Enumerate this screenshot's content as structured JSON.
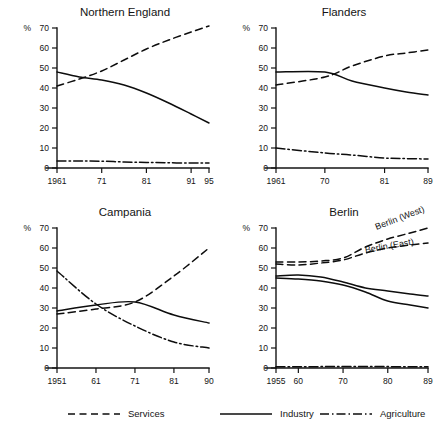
{
  "figure": {
    "title": "",
    "panel_count": 4
  },
  "legend": {
    "entries": [
      {
        "label": "Services",
        "style": "dashed"
      },
      {
        "label": "Industry",
        "style": "solid"
      },
      {
        "label": "Agriculture",
        "style": "dashdot"
      }
    ]
  },
  "chart_data": [
    {
      "type": "line",
      "title": "Northern England",
      "xlabel": "",
      "ylabel": "%",
      "ylim": [
        0,
        70
      ],
      "yticks": [
        0,
        10,
        20,
        30,
        40,
        50,
        60,
        70
      ],
      "xlim": [
        1961,
        1995
      ],
      "xticks": [
        1961,
        1971,
        1981,
        1991,
        1995
      ],
      "xticklabels": [
        "1961",
        "71",
        "81",
        "91",
        "95"
      ],
      "grid": false,
      "legend_position": "figure-bottom",
      "series": [
        {
          "name": "Services",
          "style": "dashed",
          "x": [
            1961,
            1966,
            1971,
            1976,
            1981,
            1986,
            1991,
            1995
          ],
          "values": [
            41.0,
            44.5,
            48.5,
            54.0,
            59.5,
            64.0,
            68.0,
            71.0
          ]
        },
        {
          "name": "Industry",
          "style": "solid",
          "x": [
            1961,
            1966,
            1971,
            1976,
            1981,
            1986,
            1991,
            1995
          ],
          "values": [
            48.0,
            45.5,
            44.0,
            41.5,
            37.5,
            32.5,
            27.0,
            22.5
          ]
        },
        {
          "name": "Agriculture",
          "style": "dashdot",
          "x": [
            1961,
            1966,
            1971,
            1976,
            1981,
            1986,
            1991,
            1995
          ],
          "values": [
            3.5,
            3.5,
            3.4,
            3.0,
            2.8,
            2.6,
            2.5,
            2.5
          ]
        }
      ]
    },
    {
      "type": "line",
      "title": "Flanders",
      "xlabel": "",
      "ylabel": "%",
      "ylim": [
        0,
        70
      ],
      "yticks": [
        0,
        10,
        20,
        30,
        40,
        50,
        60,
        70
      ],
      "xlim": [
        1961,
        1989
      ],
      "xticks": [
        1961,
        1970,
        1981,
        1989
      ],
      "xticklabels": [
        "1961",
        "70",
        "81",
        "89"
      ],
      "grid": false,
      "legend_position": "figure-bottom",
      "series": [
        {
          "name": "Services",
          "style": "dashed",
          "x": [
            1961,
            1970,
            1975,
            1981,
            1985,
            1989
          ],
          "values": [
            41.5,
            45.5,
            51.0,
            56.0,
            57.5,
            59.0
          ]
        },
        {
          "name": "Industry",
          "style": "solid",
          "x": [
            1961,
            1970,
            1975,
            1981,
            1985,
            1989
          ],
          "values": [
            48.0,
            48.0,
            43.5,
            40.0,
            38.0,
            36.5
          ]
        },
        {
          "name": "Agriculture",
          "style": "dashdot",
          "x": [
            1961,
            1970,
            1975,
            1981,
            1985,
            1989
          ],
          "values": [
            10.0,
            7.5,
            6.5,
            5.0,
            4.7,
            4.5
          ]
        }
      ]
    },
    {
      "type": "line",
      "title": "Campania",
      "xlabel": "",
      "ylabel": "%",
      "ylim": [
        0,
        70
      ],
      "yticks": [
        0,
        10,
        20,
        30,
        40,
        50,
        60,
        70
      ],
      "xlim": [
        1951,
        1990
      ],
      "xticks": [
        1951,
        1961,
        1971,
        1981,
        1990
      ],
      "xticklabels": [
        "1951",
        "61",
        "71",
        "81",
        "90"
      ],
      "grid": false,
      "legend_position": "figure-bottom",
      "series": [
        {
          "name": "Services",
          "style": "dashed",
          "x": [
            1951,
            1961,
            1971,
            1981,
            1990
          ],
          "values": [
            27.0,
            29.5,
            33.0,
            46.0,
            60.0
          ]
        },
        {
          "name": "Industry",
          "style": "solid",
          "x": [
            1951,
            1961,
            1971,
            1981,
            1990
          ],
          "values": [
            28.5,
            31.5,
            33.0,
            26.5,
            22.5
          ]
        },
        {
          "name": "Agriculture",
          "style": "dashdot",
          "x": [
            1951,
            1961,
            1971,
            1981,
            1990
          ],
          "values": [
            48.5,
            32.0,
            21.0,
            13.0,
            10.0
          ]
        }
      ]
    },
    {
      "type": "line",
      "title": "Berlin",
      "xlabel": "",
      "ylabel": "%",
      "ylim": [
        0,
        70
      ],
      "yticks": [
        0,
        10,
        20,
        30,
        40,
        50,
        60,
        70
      ],
      "xlim": [
        1955,
        1989
      ],
      "xticks": [
        1955,
        1960,
        1970,
        1980,
        1989
      ],
      "xticklabels": [
        "1955",
        "60",
        "70",
        "80",
        "89"
      ],
      "grid": false,
      "legend_position": "figure-bottom",
      "annotations": [
        {
          "text": "Berlin (West)",
          "x": 1977.5,
          "y": 69.0,
          "rotate": -21
        },
        {
          "text": "Berlin (East)",
          "x": 1975.0,
          "y": 57.5,
          "rotate": -10
        }
      ],
      "series": [
        {
          "name": "Services",
          "sublabel": "Berlin (West)",
          "style": "dashed",
          "x": [
            1955,
            1960,
            1965,
            1970,
            1975,
            1980,
            1985,
            1989
          ],
          "values": [
            53.0,
            53.0,
            53.5,
            55.0,
            60.5,
            64.5,
            67.5,
            70.0
          ]
        },
        {
          "name": "Services",
          "sublabel": "Berlin (East)",
          "style": "dashed",
          "x": [
            1955,
            1960,
            1965,
            1970,
            1975,
            1980,
            1985,
            1989
          ],
          "values": [
            52.0,
            51.5,
            52.5,
            54.0,
            57.5,
            60.0,
            61.5,
            62.5
          ]
        },
        {
          "name": "Industry",
          "sublabel": "Berlin (West)",
          "style": "solid",
          "x": [
            1955,
            1960,
            1965,
            1970,
            1975,
            1980,
            1985,
            1989
          ],
          "values": [
            46.0,
            46.5,
            45.5,
            43.0,
            40.0,
            38.5,
            37.0,
            36.0
          ]
        },
        {
          "name": "Industry",
          "sublabel": "Berlin (East)",
          "style": "solid",
          "x": [
            1955,
            1960,
            1965,
            1970,
            1975,
            1980,
            1985,
            1989
          ],
          "values": [
            45.0,
            44.5,
            43.5,
            41.5,
            38.0,
            33.5,
            31.5,
            30.0
          ]
        },
        {
          "name": "Agriculture",
          "style": "dashdot",
          "x": [
            1955,
            1960,
            1965,
            1970,
            1975,
            1980,
            1985,
            1989
          ],
          "values": [
            0.6,
            0.6,
            0.7,
            0.8,
            0.8,
            0.7,
            0.6,
            0.6
          ]
        }
      ]
    }
  ]
}
